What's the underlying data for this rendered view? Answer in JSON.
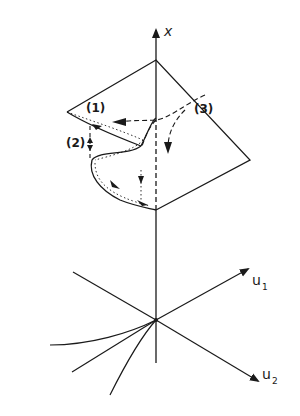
{
  "diagram": {
    "type": "cusp-catastrophe-surface",
    "axes": {
      "vertical": {
        "label": "x"
      },
      "control_1": {
        "label": "u",
        "subscript": "1"
      },
      "control_2": {
        "label": "u",
        "subscript": "2"
      }
    },
    "path_labels": [
      {
        "id": "path-1",
        "text": "(1)"
      },
      {
        "id": "path-2",
        "text": "(2)"
      },
      {
        "id": "path-3",
        "text": "(3)"
      }
    ],
    "colors": {
      "ink": "#1a1a1a",
      "background": "#ffffff"
    }
  }
}
